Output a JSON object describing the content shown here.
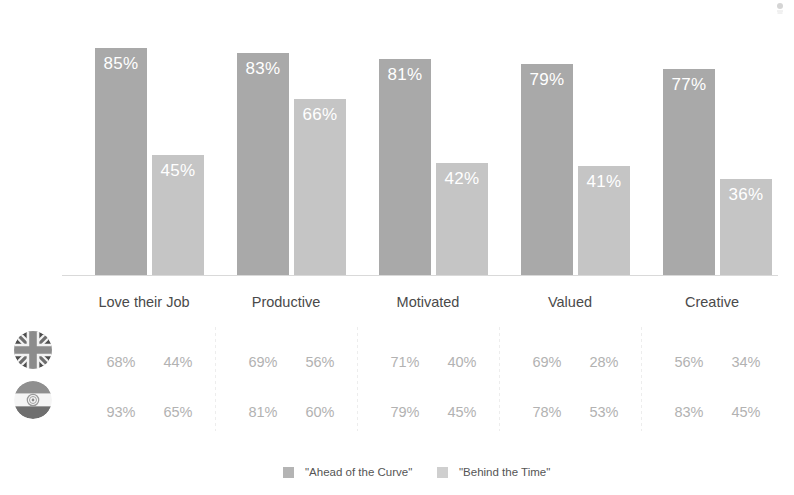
{
  "chart_data": {
    "type": "bar",
    "title": "",
    "subtitle": "",
    "xlabel": "",
    "ylabel": "",
    "ylim": [
      0,
      100
    ],
    "grid": false,
    "legend_position": "bottom",
    "categories": [
      "Love their Job",
      "Productive",
      "Motivated",
      "Valued",
      "Creative"
    ],
    "series": [
      {
        "name": "\"Ahead of the Curve\"",
        "color": "#a9a9a9",
        "values": [
          85,
          83,
          81,
          79,
          77
        ],
        "labels": [
          "85%",
          "83%",
          "81%",
          "79%",
          "77%"
        ]
      },
      {
        "name": "\"Behind the Time\"",
        "color": "#c5c5c5",
        "values": [
          45,
          66,
          42,
          41,
          36
        ],
        "labels": [
          "45%",
          "66%",
          "42%",
          "41%",
          "36%"
        ]
      }
    ],
    "table": {
      "rows": [
        {
          "icon": "uk-flag-icon",
          "name": "United Kingdom",
          "values": [
            [
              "68%",
              "44%"
            ],
            [
              "69%",
              "56%"
            ],
            [
              "71%",
              "40%"
            ],
            [
              "69%",
              "28%"
            ],
            [
              "56%",
              "34%"
            ]
          ]
        },
        {
          "icon": "india-flag-icon",
          "name": "India",
          "values": [
            [
              "93%",
              "65%"
            ],
            [
              "81%",
              "60%"
            ],
            [
              "79%",
              "45%"
            ],
            [
              "78%",
              "53%"
            ],
            [
              "83%",
              "45%"
            ]
          ]
        }
      ]
    }
  },
  "legend": {
    "items": [
      {
        "label": "\"Ahead of the Curve\"",
        "color": "#b4b4b4"
      },
      {
        "label": "\"Behind the Time\"",
        "color": "#cfcfcf"
      }
    ]
  },
  "colors": {
    "series_dark": "#a9a9a9",
    "series_light": "#c5c5c5",
    "axis": "#d9d9d9",
    "category_text": "#4a4a4a",
    "table_text": "#b2b2b2",
    "value_text": "#ffffff"
  }
}
